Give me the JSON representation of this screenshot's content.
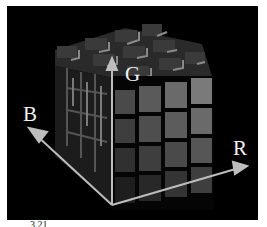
{
  "figure": {
    "axes": {
      "r_label": "R",
      "g_label": "G",
      "b_label": "B"
    },
    "grid": {
      "rows": 4,
      "cols": 4,
      "depth": 4
    },
    "caption_fragment": "3.21",
    "colors": {
      "background": "#000000",
      "axis": "#bdbdbd",
      "label": "#f2f2f2"
    }
  }
}
